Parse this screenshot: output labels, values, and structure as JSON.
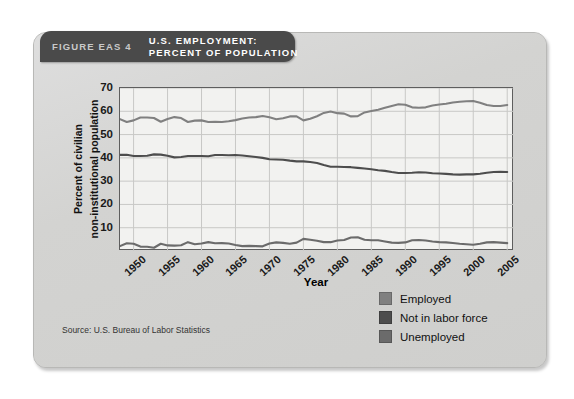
{
  "figure": {
    "number_label": "FIGURE EAS 4",
    "title_line1": "U.S. EMPLOYMENT:",
    "title_line2": "PERCENT OF POPULATION",
    "source": "Source: U.S. Bureau of Labor Statistics",
    "banner_bg": "#4a4a4a",
    "card_bg": "#d4d4d2",
    "plot_bg": "#f2f2f0"
  },
  "legend": {
    "position": "bottom-right",
    "items": [
      {
        "label": "Employed",
        "color": "#808080"
      },
      {
        "label": "Not in labor force",
        "color": "#4d4d4d"
      },
      {
        "label": "Unemployed",
        "color": "#6b6b6b"
      }
    ]
  },
  "chart_data": {
    "type": "line",
    "title": "U.S. EMPLOYMENT: PERCENT OF POPULATION",
    "xlabel": "Year",
    "ylabel": "Percent of civilian non-institutional population",
    "ylabel_line1": "Percent of civilian",
    "ylabel_line2": "non-institutional population",
    "xlim": [
      1948,
      2006
    ],
    "ylim": [
      0,
      70
    ],
    "yticks": [
      70,
      60,
      50,
      40,
      30,
      20,
      10
    ],
    "xticks": [
      1950,
      1955,
      1960,
      1965,
      1970,
      1975,
      1980,
      1985,
      1990,
      1995,
      2000,
      2005
    ],
    "grid": true,
    "legend_position": "outside bottom-right",
    "x": [
      1948,
      1949,
      1950,
      1951,
      1952,
      1953,
      1954,
      1955,
      1956,
      1957,
      1958,
      1959,
      1960,
      1961,
      1962,
      1963,
      1964,
      1965,
      1966,
      1967,
      1968,
      1969,
      1970,
      1971,
      1972,
      1973,
      1974,
      1975,
      1976,
      1977,
      1978,
      1979,
      1980,
      1981,
      1982,
      1983,
      1984,
      1985,
      1986,
      1987,
      1988,
      1989,
      1990,
      1991,
      1992,
      1993,
      1994,
      1995,
      1996,
      1997,
      1998,
      1999,
      2000,
      2001,
      2002,
      2003,
      2004,
      2005
    ],
    "series": [
      {
        "name": "Employed",
        "color": "#808080",
        "values": [
          56.6,
          55.4,
          56.1,
          57.3,
          57.3,
          57.1,
          55.5,
          56.7,
          57.5,
          57.1,
          55.4,
          56.0,
          56.1,
          55.4,
          55.5,
          55.4,
          55.7,
          56.2,
          56.9,
          57.3,
          57.5,
          58.0,
          57.4,
          56.6,
          57.0,
          57.8,
          57.8,
          56.1,
          56.8,
          57.9,
          59.3,
          59.9,
          59.2,
          59.0,
          57.8,
          57.9,
          59.5,
          60.1,
          60.7,
          61.5,
          62.3,
          63.0,
          62.8,
          61.7,
          61.5,
          61.7,
          62.5,
          62.9,
          63.2,
          63.8,
          64.1,
          64.3,
          64.4,
          63.7,
          62.7,
          62.3,
          62.3,
          62.7
        ]
      },
      {
        "name": "Not in labor force",
        "color": "#4d4d4d",
        "values": [
          41.3,
          41.3,
          40.8,
          40.8,
          40.9,
          41.5,
          41.4,
          40.9,
          40.2,
          40.4,
          40.8,
          40.8,
          40.8,
          40.7,
          41.2,
          41.2,
          41.1,
          41.2,
          41.0,
          40.7,
          40.4,
          40.0,
          39.4,
          39.3,
          39.2,
          38.8,
          38.5,
          38.5,
          38.2,
          37.8,
          36.9,
          36.2,
          36.2,
          36.1,
          36.0,
          35.7,
          35.4,
          35.1,
          34.7,
          34.4,
          33.9,
          33.5,
          33.5,
          33.6,
          33.8,
          33.7,
          33.4,
          33.3,
          33.1,
          32.9,
          32.8,
          32.9,
          32.9,
          33.2,
          33.6,
          33.9,
          34.0,
          33.9
        ]
      },
      {
        "name": "Unemployed",
        "color": "#6b6b6b",
        "values": [
          2.1,
          3.3,
          3.1,
          1.9,
          1.8,
          1.4,
          3.1,
          2.4,
          2.3,
          2.5,
          3.8,
          2.9,
          3.2,
          3.8,
          3.3,
          3.4,
          3.2,
          2.6,
          2.1,
          2.2,
          2.1,
          2.0,
          3.2,
          3.7,
          3.5,
          3.1,
          3.6,
          5.2,
          4.8,
          4.4,
          3.8,
          3.8,
          4.5,
          4.7,
          5.8,
          5.9,
          4.8,
          4.6,
          4.6,
          4.1,
          3.6,
          3.5,
          3.7,
          4.6,
          4.7,
          4.5,
          4.1,
          3.8,
          3.7,
          3.4,
          3.1,
          2.9,
          2.7,
          3.1,
          3.7,
          3.8,
          3.6,
          3.4
        ]
      }
    ]
  }
}
